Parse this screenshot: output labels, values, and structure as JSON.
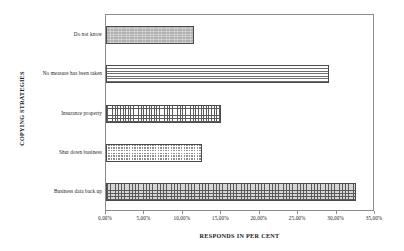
{
  "chart_data": {
    "type": "bar",
    "orientation": "horizontal",
    "title": "",
    "xlabel": "RESPONDS IN PER CENT",
    "ylabel": "COPYING STRATEGIES",
    "categories": [
      "Business data back up",
      "Shut down business",
      "Insurance property",
      "No measure has been taken",
      "Do not know"
    ],
    "values": [
      32.5,
      12.5,
      15.0,
      29.0,
      11.5
    ],
    "xlim": [
      0,
      35
    ],
    "xticks": [
      0,
      5,
      10,
      15,
      20,
      25,
      30,
      35
    ],
    "xtick_labels": [
      "0,00%",
      "5,00%",
      "10,00%",
      "15,00%",
      "20,00%",
      "25,00%",
      "30,00%",
      "35,00%"
    ],
    "grid": false,
    "legend": "none",
    "bar_patterns": [
      "light-checkerboard",
      "dense-checker",
      "fine-grid",
      "horizontal-lines",
      "grey-speckle"
    ]
  },
  "axes": {
    "y_title": "COPYING STRATEGIES",
    "x_title": "RESPONDS IN PER CENT"
  },
  "categories": [
    {
      "label": "Do not know",
      "value": 11.5,
      "pattern": "grey-speckle"
    },
    {
      "label": "No measure has been taken",
      "value": 29.0,
      "pattern": "horizontal-lines"
    },
    {
      "label": "Insurance property",
      "value": 15.0,
      "pattern": "fine-grid"
    },
    {
      "label": "Shut down business",
      "value": 12.5,
      "pattern": "dense-checker"
    },
    {
      "label": "Business data back up",
      "value": 32.5,
      "pattern": "light-checkerboard"
    }
  ],
  "xticks": [
    {
      "label": "0,00%",
      "value": 0
    },
    {
      "label": "5,00%",
      "value": 5
    },
    {
      "label": "10,00%",
      "value": 10
    },
    {
      "label": "15,00%",
      "value": 15
    },
    {
      "label": "20,00%",
      "value": 20
    },
    {
      "label": "25,00%",
      "value": 25
    },
    {
      "label": "30,00%",
      "value": 30
    },
    {
      "label": "35,00%",
      "value": 35
    }
  ],
  "colors": {
    "frame": "#8c8c8c",
    "bar_outline": "#4a4a4a",
    "background": "#ffffff",
    "text": "#1a1a1a"
  }
}
